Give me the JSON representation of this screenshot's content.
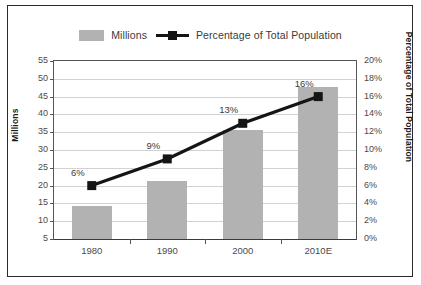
{
  "chart_data": {
    "type": "bar",
    "title": "",
    "subtitle": "",
    "categories": [
      "1980",
      "1990",
      "2000",
      "2010E"
    ],
    "series": [
      {
        "name": "Millions",
        "type": "bar",
        "axis": "left",
        "color": "#b2b2b2",
        "values": [
          14.3,
          21.2,
          35.5,
          47.7
        ],
        "data_labels": [
          "",
          "",
          "",
          ""
        ]
      },
      {
        "name": "Percentage of Total Population",
        "type": "line",
        "axis": "right",
        "color": "#151515",
        "marker": "square",
        "values": [
          6,
          9,
          13,
          16
        ],
        "data_labels": [
          "6%",
          "9%",
          "13%",
          "16%"
        ]
      }
    ],
    "xlabel": "",
    "ylabel": "Millions",
    "y2label": "Percentage of Total Population",
    "ylim": [
      5,
      55
    ],
    "y2lim": [
      0,
      20
    ],
    "yticks": [
      "5",
      "10",
      "15",
      "20",
      "25",
      "30",
      "35",
      "40",
      "45",
      "50",
      "55"
    ],
    "ytick_values": [
      5,
      10,
      15,
      20,
      25,
      30,
      35,
      40,
      45,
      50,
      55
    ],
    "y2ticks": [
      "0%",
      "2%",
      "4%",
      "6%",
      "8%",
      "10%",
      "12%",
      "14%",
      "16%",
      "18%",
      "20%"
    ],
    "y2tick_values": [
      0,
      2,
      4,
      6,
      8,
      10,
      12,
      14,
      16,
      18,
      20
    ],
    "grid": true,
    "grid_axis": "y",
    "legend_position": "top"
  },
  "legend": {
    "entries": [
      {
        "label": "Millions",
        "marker": "bar-swatch"
      },
      {
        "label": "Percentage of Total Population",
        "marker": "line-square-swatch"
      }
    ]
  },
  "axes": {
    "left_title": "Millions",
    "right_title": "Percentage of Total Population"
  }
}
